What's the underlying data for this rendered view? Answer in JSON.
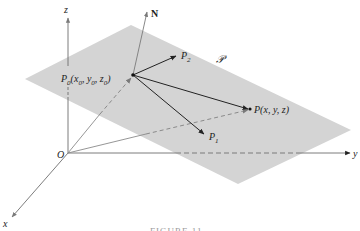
{
  "diagram": {
    "colors": {
      "plane": "#d4d4d4",
      "axis": "#6e6e6e",
      "vector": "#222222",
      "gray_vector": "#8a8a8a",
      "text": "#222222",
      "caption": "#9a9a9a"
    },
    "axes": {
      "x_label": "x",
      "y_label": "y",
      "z_label": "z",
      "origin_label": "O"
    },
    "plane_label": "𝒫",
    "normal_label": "N",
    "points": {
      "p0": {
        "name": "P",
        "sub": "0",
        "coords_open": "(x",
        "c1_sub": "0",
        "sep1": ", y",
        "c2_sub": "0",
        "sep2": ", z",
        "c3_sub": "0",
        "close": ")"
      },
      "p1": {
        "name": "P",
        "sub": "1"
      },
      "p2": {
        "name": "P",
        "sub": "2"
      },
      "p": {
        "label": "P(x, y, z)"
      }
    },
    "caption": "FIGURE 11"
  }
}
